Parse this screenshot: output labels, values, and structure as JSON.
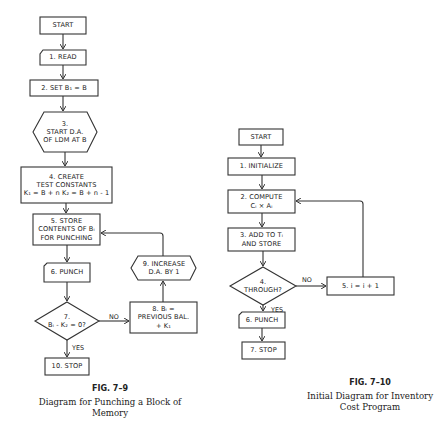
{
  "figures": [
    {
      "id": "fig-7-9",
      "number": "FIG. 7–9",
      "caption_line1": "Diagram for Punching a Block of",
      "caption_line2": "Memory",
      "nodes": {
        "start": "START",
        "n1": "1. READ",
        "n2": "2. SET B₁ = B",
        "n3_l1": "3.",
        "n3_l2": "START D.A.",
        "n3_l3": "OF LDM AT B",
        "n4_l1": "4. CREATE",
        "n4_l2": "TEST CONSTANTS",
        "n4_l3": "K₁ = B + n  K₂ = B + n - 1",
        "n5_l1": "5. STORE",
        "n5_l2": "CONTENTS OF Bᵢ",
        "n5_l3": "FOR PUNCHING",
        "n6": "6. PUNCH",
        "n7_l1": "7.",
        "n7_l2": "Bᵢ - K₂ = 0?",
        "n8_l1": "8. Bᵢ =",
        "n8_l2": "PREVIOUS BAL.",
        "n8_l3": "+ K₁",
        "n9_l1": "9. INCREASE",
        "n9_l2": "D.A. BY 1",
        "n10": "10. STOP"
      },
      "edge_labels": {
        "no": "NO",
        "yes": "YES"
      }
    },
    {
      "id": "fig-7-10",
      "number": "FIG. 7–10",
      "caption_line1": "Initial Diagram for Inventory",
      "caption_line2": "Cost Program",
      "nodes": {
        "start": "START",
        "n1": "1. INITIALIZE",
        "n2_l1": "2. COMPUTE",
        "n2_l2": "Cᵢ × Aᵢ",
        "n3_l1": "3. ADD TO Tᵢ",
        "n3_l2": "AND STORE",
        "n4_l1": "4.",
        "n4_l2": "THROUGH?",
        "n5": "5. i = i + 1",
        "n6": "6. PUNCH",
        "n7": "7. STOP"
      },
      "edge_labels": {
        "no": "NO",
        "yes": "YES"
      }
    }
  ]
}
